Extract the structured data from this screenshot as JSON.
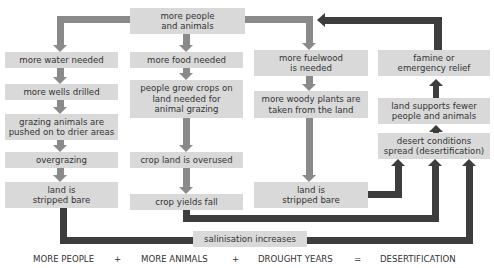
{
  "diagram": {
    "top": {
      "label": "more people\nand animals"
    },
    "column_water": [
      {
        "label": "more water needed"
      },
      {
        "label": "more wells drilled"
      },
      {
        "label": "grazing animals are\npushed on to drier areas"
      },
      {
        "label": "overgrazing"
      },
      {
        "label": "land is\nstripped bare"
      }
    ],
    "column_food": [
      {
        "label": "more food needed"
      },
      {
        "label": "people grow crops on\nland needed for\nanimal grazing"
      },
      {
        "label": "crop land is overused"
      },
      {
        "label": "crop yields fall"
      }
    ],
    "column_fuel": [
      {
        "label": "more fuelwood\nis needed"
      },
      {
        "label": "more woody plants are\ntaken from the land"
      },
      {
        "label": "land is\nstripped bare"
      }
    ],
    "column_outcome": [
      {
        "label": "famine or\nemergency relief"
      },
      {
        "label": "land supports fewer\npeople and animals"
      },
      {
        "label": "desert conditions\nspread (desertification)"
      }
    ],
    "salinisation": {
      "label": "salinisation increases"
    },
    "formula": {
      "term1": "MORE PEOPLE",
      "plus1": "+",
      "term2": "MORE ANIMALS",
      "plus2": "+",
      "term3": "DROUGHT YEARS",
      "equals": "=",
      "result": "DESERTIFICATION"
    },
    "colors": {
      "box_fill": "#d9d9d9",
      "grey_arrow": "#8a8a8a",
      "dark_arrow": "#3d3d3d"
    }
  }
}
